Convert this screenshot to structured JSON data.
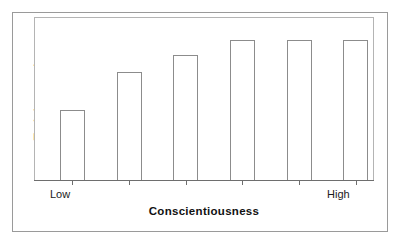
{
  "chart_data": {
    "type": "bar",
    "title": "",
    "xlabel": "Conscientiousness",
    "ylabel": "Training  grade",
    "categories": [
      "Low",
      "",
      "",
      "",
      "",
      "High"
    ],
    "tick_labels": {
      "left": "Low",
      "right": "High"
    },
    "values": [
      43,
      66,
      77,
      86,
      86,
      86
    ],
    "ylim": [
      0,
      100
    ],
    "xlim": [
      0,
      6
    ],
    "grid": false,
    "legend": null,
    "bar_style": {
      "fill": "#ffffff",
      "edge": "#8c8c8c"
    },
    "axis_style": {
      "axis_line": "#6e6e6e",
      "plot_border": "#b4b4b4",
      "frame_border": "#9a9a9a"
    },
    "annotations": []
  },
  "figure": {
    "y_axis_title": "Training  grade",
    "x_axis_title": "Conscientiousness",
    "x_label_low": "Low",
    "x_label_high": "High"
  }
}
